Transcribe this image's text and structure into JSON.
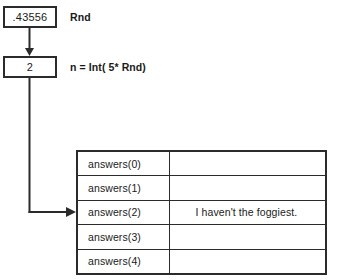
{
  "diagram": {
    "steps": [
      {
        "id": "rnd",
        "box_value": ".43556",
        "label": "Rnd"
      },
      {
        "id": "index",
        "box_value": "2",
        "label": "n = Int( 5* Rnd)"
      }
    ],
    "table": {
      "rows": [
        {
          "index_label": "answers(0)",
          "value": ""
        },
        {
          "index_label": "answers(1)",
          "value": ""
        },
        {
          "index_label": "answers(2)",
          "value": "I haven't the foggiest."
        },
        {
          "index_label": "answers(3)",
          "value": ""
        },
        {
          "index_label": "answers(4)",
          "value": ""
        }
      ],
      "highlighted_row_index": 2
    },
    "colors": {
      "stroke": "#2b2b2b",
      "text": "#1a1a1a",
      "background": "#ffffff"
    },
    "connector_icons": {
      "down_arrow": "arrow-down-icon",
      "elbow_arrow": "arrow-elbow-right-icon"
    }
  }
}
